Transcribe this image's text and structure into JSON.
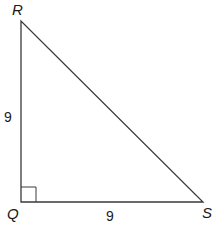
{
  "diagram": {
    "type": "right-triangle",
    "vertices": [
      {
        "id": "R",
        "label": "R",
        "x": 21,
        "y": 21
      },
      {
        "id": "Q",
        "label": "Q",
        "x": 21,
        "y": 202
      },
      {
        "id": "S",
        "label": "S",
        "x": 203,
        "y": 202
      }
    ],
    "right_angle_at": "Q",
    "sides": {
      "RQ": {
        "label": "9"
      },
      "QS": {
        "label": "9"
      },
      "RS": {
        "label": ""
      }
    },
    "colors": {
      "stroke": "#3a3a3a",
      "text": "#1a1a1a",
      "background": "#ffffff"
    }
  }
}
